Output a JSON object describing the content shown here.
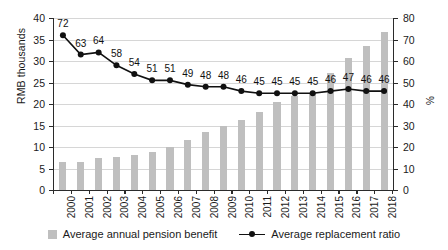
{
  "chart_data": {
    "type": "bar",
    "title": "",
    "subtitle": "",
    "xlabel": "",
    "ylabel": "RMB thousands",
    "y2label": "%",
    "ylim": [
      0,
      40
    ],
    "y2lim": [
      0,
      80
    ],
    "yticks": [
      0,
      5,
      10,
      15,
      20,
      25,
      30,
      35,
      40
    ],
    "y2ticks": [
      0,
      10,
      20,
      30,
      40,
      50,
      60,
      70,
      80
    ],
    "grid": true,
    "legend_position": "bottom",
    "categories": [
      "2000",
      "2001",
      "2002",
      "2003",
      "2004",
      "2005",
      "2006",
      "2007",
      "2008",
      "2009",
      "2010",
      "2011",
      "2012",
      "2013",
      "2014",
      "2015",
      "2016",
      "2017",
      "2018"
    ],
    "series": [
      {
        "name": "Average annual pension benefit",
        "type": "bar",
        "axis": "left",
        "unit": "RMB thousands",
        "color": "#bfbfbf",
        "values": [
          6.4,
          6.5,
          7.4,
          7.7,
          8.1,
          8.8,
          10.1,
          11.6,
          13.5,
          14.8,
          16.2,
          18.2,
          20.4,
          21.8,
          22.5,
          27.3,
          30.6,
          33.4,
          36.7
        ]
      },
      {
        "name": "Average replacement ratio",
        "type": "line",
        "axis": "right",
        "unit": "%",
        "color": "#111111",
        "values": [
          72,
          63,
          64,
          58,
          54,
          51,
          51,
          49,
          48,
          48,
          46,
          45,
          45,
          45,
          45,
          46,
          47,
          46,
          46
        ],
        "data_labels": [
          "72",
          "63",
          "64",
          "58",
          "54",
          "51",
          "51",
          "49",
          "48",
          "48",
          "46",
          "45",
          "45",
          "45",
          "45",
          "46",
          "47",
          "46",
          "46"
        ]
      }
    ]
  },
  "legend": {
    "items": [
      {
        "label": "Average annual pension benefit",
        "marker": "bar-swatch-icon"
      },
      {
        "label": "Average replacement ratio",
        "marker": "line-marker-icon"
      }
    ]
  }
}
